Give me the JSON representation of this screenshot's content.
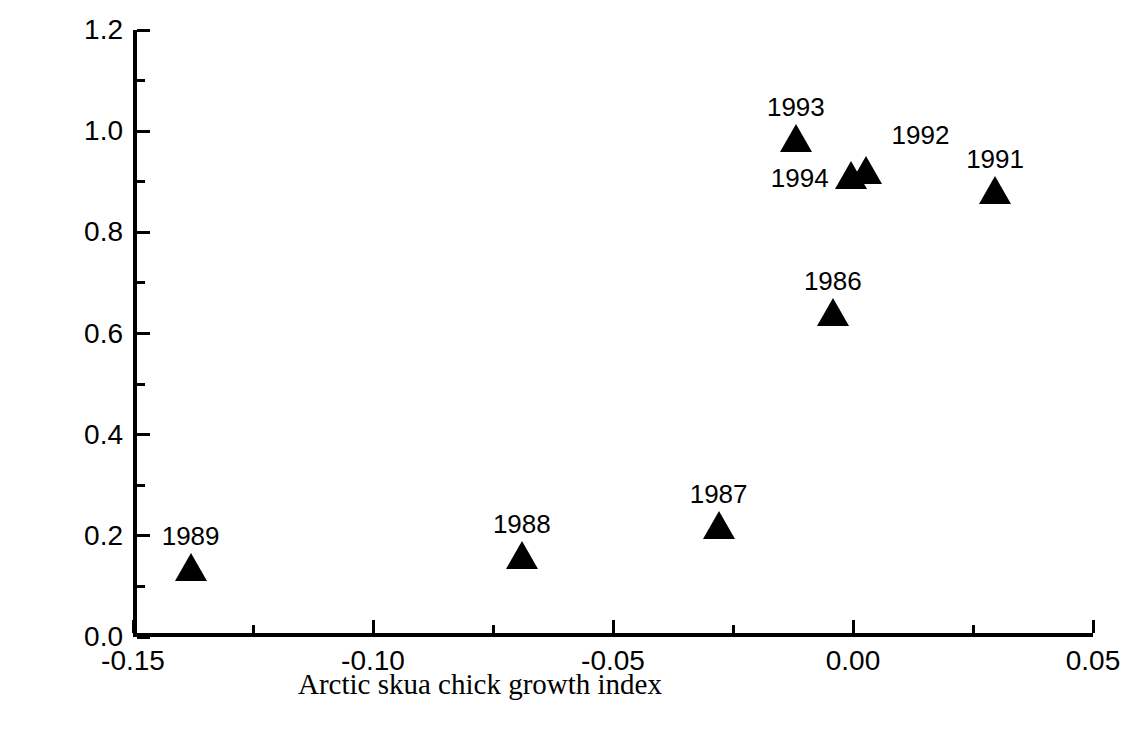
{
  "chart_data": {
    "type": "scatter",
    "title": "",
    "xlabel": "Arctic skua chick growth index",
    "ylabel": "Number of fledglings per pair",
    "xlim": [
      -0.15,
      0.05
    ],
    "ylim": [
      0.0,
      1.2
    ],
    "x_major_ticks": [
      -0.15,
      -0.1,
      -0.05,
      0.0,
      0.05
    ],
    "x_tick_labels": [
      "-0.15",
      "-0.10",
      "-0.05",
      "0.00",
      "0.05"
    ],
    "x_minor_step": 0.025,
    "y_major_ticks": [
      0.0,
      0.2,
      0.4,
      0.6,
      0.8,
      1.0,
      1.2
    ],
    "y_tick_labels": [
      "0.0",
      "0.2",
      "0.4",
      "0.6",
      "0.8",
      "1.0",
      "1.2"
    ],
    "y_minor_step": 0.1,
    "grid": false,
    "legend": false,
    "marker": "triangle-up",
    "marker_color": "#000000",
    "points": [
      {
        "label": "1989",
        "x": -0.138,
        "y": 0.13,
        "label_pos": "above"
      },
      {
        "label": "1988",
        "x": -0.069,
        "y": 0.155,
        "label_pos": "above"
      },
      {
        "label": "1987",
        "x": -0.028,
        "y": 0.213,
        "label_pos": "above"
      },
      {
        "label": "1986",
        "x": -0.0042,
        "y": 0.635,
        "label_pos": "above"
      },
      {
        "label": "1993",
        "x": -0.0119,
        "y": 0.978,
        "label_pos": "above"
      },
      {
        "label": "1994",
        "x": -0.0005,
        "y": 0.905,
        "label_pos": "left"
      },
      {
        "label": "1992",
        "x": 0.0028,
        "y": 0.915,
        "label_pos": "above-right"
      },
      {
        "label": "1991",
        "x": 0.0296,
        "y": 0.875,
        "label_pos": "above"
      }
    ]
  },
  "colors": {
    "axis": "#000000",
    "marker": "#000000",
    "background": "#ffffff"
  }
}
